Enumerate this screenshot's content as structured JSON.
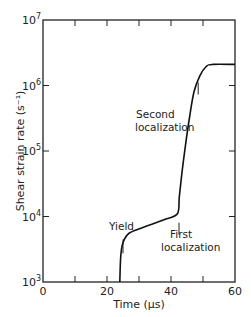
{
  "chart_data": {
    "type": "line",
    "title": "",
    "xlabel": "Time (µs)",
    "ylabel": "Shear strain rate (s⁻¹)",
    "xlim": [
      0,
      60
    ],
    "ylim": [
      1000,
      10000000
    ],
    "yscale": "log",
    "grid": false,
    "x_ticks": [
      0,
      20,
      40,
      60
    ],
    "x_minor_ticks": [
      10,
      30,
      50
    ],
    "y_ticks": [
      {
        "base": "10",
        "exp": "3",
        "value": 1000
      },
      {
        "base": "10",
        "exp": "4",
        "value": 10000
      },
      {
        "base": "10",
        "exp": "5",
        "value": 100000
      },
      {
        "base": "10",
        "exp": "6",
        "value": 1000000
      },
      {
        "base": "10",
        "exp": "7",
        "value": 10000000
      }
    ],
    "series": [
      {
        "name": "strain rate",
        "x": [
          24,
          24.3,
          25,
          27,
          32,
          38,
          42,
          42.6,
          43.5,
          44.5,
          45.8,
          47.2,
          49,
          51,
          53,
          60
        ],
        "y": [
          1000,
          2500,
          4000,
          5600,
          7000,
          9000,
          11000,
          20000,
          50000,
          120000,
          330000,
          800000,
          1400000,
          1950000,
          2100000,
          2100000
        ]
      }
    ],
    "annotations": [
      {
        "text": "Yield",
        "x": 25,
        "y": 3500
      },
      {
        "text": "First",
        "x": 42.5,
        "y": 6500
      },
      {
        "text": "localization",
        "x": 42.5,
        "y": 6500
      },
      {
        "text": "Second",
        "x": 48.5,
        "y": 900000
      },
      {
        "text": "localization",
        "x": 48.5,
        "y": 900000
      }
    ]
  }
}
